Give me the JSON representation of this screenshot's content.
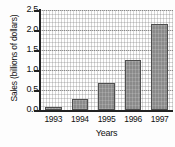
{
  "chart_data": {
    "type": "bar",
    "title": "",
    "subtitle": "",
    "xlabel": "Years",
    "ylabel": "Sales (billions of dollars)",
    "categories": [
      "1993",
      "1994",
      "1995",
      "1996",
      "1997"
    ],
    "values": [
      0.08,
      0.28,
      0.68,
      1.25,
      2.15
    ],
    "series": [
      {
        "name": "Sales",
        "values": [
          0.08,
          0.28,
          0.68,
          1.25,
          2.15
        ]
      }
    ],
    "ylim": [
      0.0,
      2.5
    ],
    "ytick_labels": [
      "0.0",
      "0.5",
      "1.0",
      "1.5",
      "2.0",
      "2.5"
    ],
    "ytick_values": [
      0.0,
      0.5,
      1.0,
      1.5,
      2.0,
      2.5
    ],
    "grid": true,
    "grid_style": "dotted",
    "legend": false,
    "legend_position": "none",
    "bar_color": "#8a8a8a",
    "bar_edge_color": "#4e4e4e",
    "axis_color": "#222222",
    "background_color": "#fefefe",
    "annotations": []
  }
}
